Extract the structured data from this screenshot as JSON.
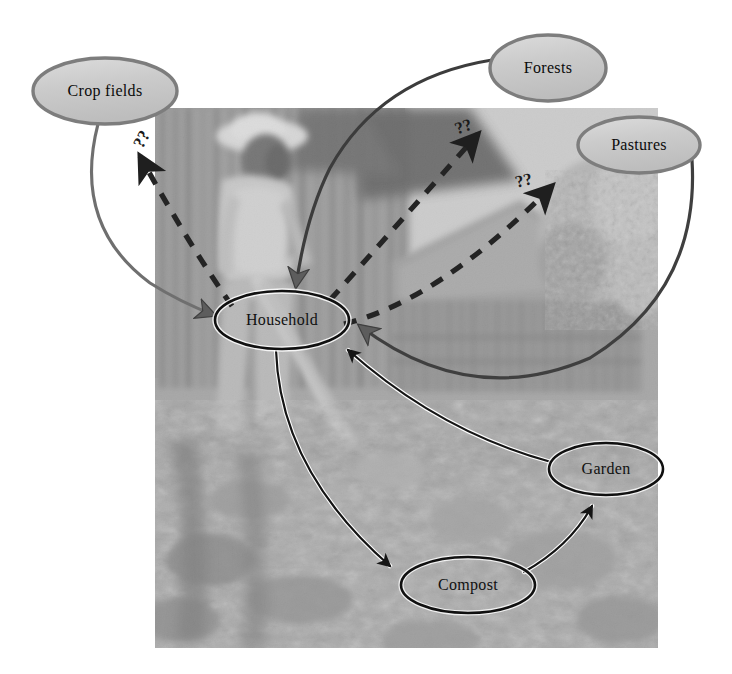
{
  "figure": {
    "type": "concept-flow-diagram",
    "caption_text": "",
    "background_photo": {
      "description": "black-and-white photograph of a farmer digging soil with a hoe in front of a bamboo-walled thatched house",
      "x": 155,
      "y": 108,
      "width": 503,
      "height": 540,
      "tone": "grayscale"
    }
  },
  "nodes": [
    {
      "id": "crop-fields",
      "label": "Crop fields",
      "cx": 105,
      "cy": 91,
      "rx": 72,
      "ry": 33,
      "style": "filled-gray"
    },
    {
      "id": "forests",
      "label": "Forests",
      "cx": 548,
      "cy": 68,
      "rx": 58,
      "ry": 33,
      "style": "filled-gray"
    },
    {
      "id": "pastures",
      "label": "Pastures",
      "cx": 639,
      "cy": 145,
      "rx": 61,
      "ry": 28,
      "style": "filled-gray"
    },
    {
      "id": "household",
      "label": "Household",
      "cx": 282,
      "cy": 320,
      "rx": 67,
      "ry": 29,
      "style": "outline-on-photo"
    },
    {
      "id": "garden",
      "label": "Garden",
      "cx": 606,
      "cy": 469,
      "rx": 57,
      "ry": 26,
      "style": "outline-on-photo"
    },
    {
      "id": "compost",
      "label": "Compost",
      "cx": 468,
      "cy": 585,
      "rx": 67,
      "ry": 28,
      "style": "outline-on-photo"
    }
  ],
  "edges": [
    {
      "id": "crop-fields-to-household",
      "from": "crop-fields",
      "to": "household",
      "line": "solid",
      "color": "#6b6b6b",
      "label": ""
    },
    {
      "id": "forests-to-household",
      "from": "forests",
      "to": "household",
      "line": "solid",
      "color": "#3a3a3a",
      "label": ""
    },
    {
      "id": "pastures-to-household",
      "from": "pastures",
      "to": "household",
      "line": "solid",
      "color": "#4a4a4a",
      "label": ""
    },
    {
      "id": "household-to-crop-fields",
      "from": "household",
      "to": "crop-fields",
      "line": "dashed",
      "color": "#262626",
      "label": "??"
    },
    {
      "id": "household-to-forests",
      "from": "household",
      "to": "forests",
      "line": "dashed",
      "color": "#262626",
      "label": "??"
    },
    {
      "id": "household-to-pastures",
      "from": "household",
      "to": "pastures",
      "line": "dashed",
      "color": "#262626",
      "label": "??"
    },
    {
      "id": "household-to-compost",
      "from": "household",
      "to": "compost",
      "line": "solid",
      "color": "#141414",
      "label": ""
    },
    {
      "id": "compost-to-garden",
      "from": "compost",
      "to": "garden",
      "line": "solid",
      "color": "#141414",
      "label": ""
    },
    {
      "id": "garden-to-household",
      "from": "garden",
      "to": "household",
      "line": "solid",
      "color": "#141414",
      "label": ""
    }
  ],
  "annotations": {
    "question_marks": [
      {
        "id": "qmark-crop-fields",
        "text": "??",
        "x": 143,
        "y": 140
      },
      {
        "id": "qmark-forests",
        "text": "??",
        "x": 464,
        "y": 128
      },
      {
        "id": "qmark-pastures",
        "text": "??",
        "x": 524,
        "y": 182
      }
    ]
  },
  "colors": {
    "node_fill_gray": "#c9c9c9",
    "node_stroke_gray": "#7d7d7d",
    "node_stroke_dark": "#121212",
    "dashed_arrow": "#262626",
    "solid_arrow_gray": "#6b6b6b",
    "page_background": "#ffffff"
  }
}
